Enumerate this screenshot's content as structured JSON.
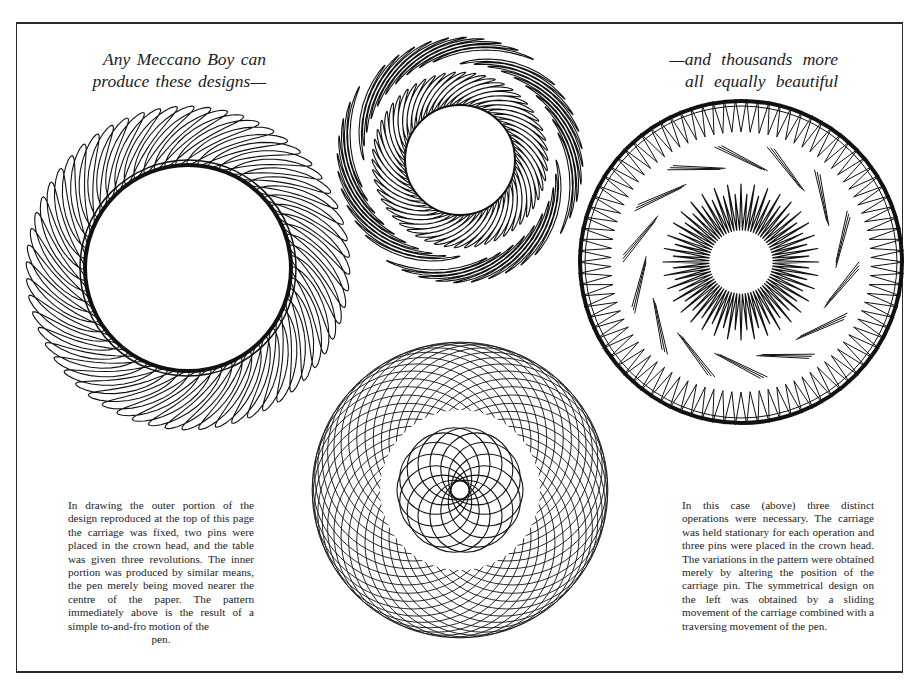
{
  "page": {
    "background": "#ffffff",
    "ink": "#111111"
  },
  "headings": {
    "left": {
      "line1": "Any Meccano Boy can",
      "line2": "produce these designs—"
    },
    "right": {
      "line1": "—and thousands more",
      "line2": "all equally beautiful"
    }
  },
  "captions": {
    "left": {
      "body": "In drawing the outer portion of the design reproduced at the top of this page the carriage was fixed, two pins were placed in the crown head, and the table was given three revolutions.  The inner portion was produced by similar means, the pen merely being moved nearer the centre of the paper.  The pattern immediately above is the result of a simple to-and-fro motion of the",
      "last": "pen."
    },
    "right": {
      "body": "In this case (above) three distinct operations were necessary.  The carriage was held stationary for each operation and three pins were placed in the crown head.  The variations in the pattern were obtained merely by altering the position of the carriage pin.  The symmetrical design on the left was obtained by a sliding movement of the carriage combined with a traversing movement of the pen."
    }
  },
  "designs": {
    "left_petal_ring": {
      "label": "left-petal-ring-design",
      "cx": 188,
      "cy": 268,
      "inner_r": 103,
      "outer_r": 162,
      "petals": 60,
      "twist": 0.55,
      "petal_width": 0.085
    },
    "top_double_feather_ring": {
      "label": "top-double-feather-ring-design",
      "cx": 460,
      "cy": 160,
      "inner_r": 55,
      "mid_r": 88,
      "outer_r": 125,
      "inner_petals": 54,
      "outer_petals": 40,
      "twist": 0.7
    },
    "right_zigzag_ring": {
      "label": "right-zigzag-ring-design",
      "cx": 741,
      "cy": 262,
      "r1": 163,
      "r2": 130,
      "spike_count": 90,
      "spiral_arms": 14,
      "inner_outer_r": 78,
      "inner_inner_r": 32,
      "inner_spikes": 36
    },
    "bottom_loop_mesh": {
      "label": "bottom-loop-mesh-design",
      "cx": 460,
      "cy": 490,
      "loop_r": 95,
      "orbit_r": 120,
      "loops": 40,
      "clear_r": 80,
      "inner_loop_r": 36,
      "inner_orbit_r": 27,
      "inner_loops": 14
    }
  }
}
